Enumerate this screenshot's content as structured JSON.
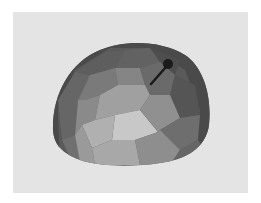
{
  "scene": {
    "subject": "faceted-hemisphere",
    "background_color": "#e4e4e4",
    "frame_color": "#ffffff",
    "pointer": {
      "type": "arrow-normal",
      "color": "#1a1a1a"
    }
  }
}
